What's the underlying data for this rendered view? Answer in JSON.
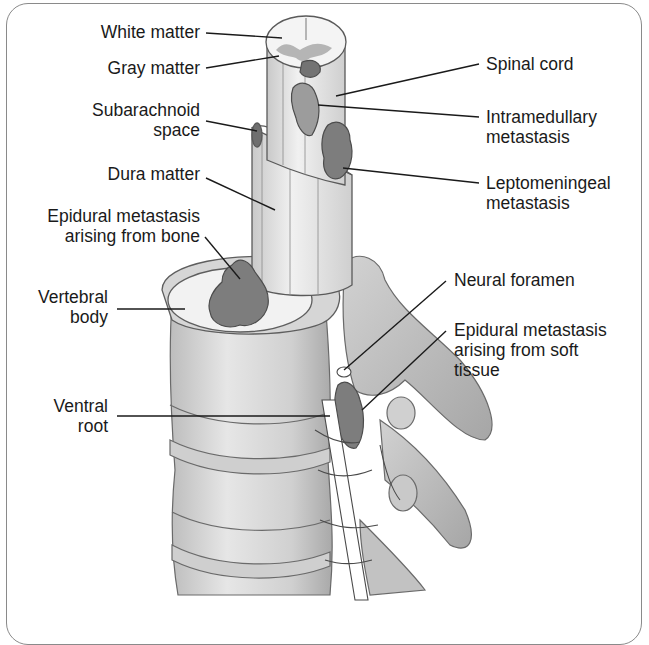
{
  "figure": {
    "labels_left": [
      {
        "id": "white-matter",
        "lines": [
          "White matter"
        ]
      },
      {
        "id": "gray-matter",
        "lines": [
          "Gray matter"
        ]
      },
      {
        "id": "subarachnoid-space",
        "lines": [
          "Subarachnoid",
          "space"
        ]
      },
      {
        "id": "dura-matter",
        "lines": [
          "Dura matter"
        ]
      },
      {
        "id": "epidural-metastasis-bone",
        "lines": [
          "Epidural metastasis",
          "arising from bone"
        ]
      },
      {
        "id": "vertebral-body",
        "lines": [
          "Vertebral",
          "body"
        ]
      },
      {
        "id": "ventral-root",
        "lines": [
          "Ventral",
          "root"
        ]
      }
    ],
    "labels_right": [
      {
        "id": "spinal-cord",
        "lines": [
          "Spinal cord"
        ]
      },
      {
        "id": "intramedullary-metastasis",
        "lines": [
          "Intramedullary",
          "metastasis"
        ]
      },
      {
        "id": "leptomeningeal-metastasis",
        "lines": [
          "Leptomeningeal",
          "metastasis"
        ]
      },
      {
        "id": "neural-foramen",
        "lines": [
          "Neural foramen"
        ]
      },
      {
        "id": "epidural-metastasis-soft-tissue",
        "lines": [
          "Epidural metastasis",
          "arising from soft",
          "tissue"
        ]
      }
    ],
    "colors": {
      "bone": "#d9d9d9",
      "bone_dark": "#b8b8b8",
      "cord": "#eeeeee",
      "tumor": "#7d7d7d",
      "line": "#1a1a1a",
      "frame": "#8a8a8a"
    }
  }
}
